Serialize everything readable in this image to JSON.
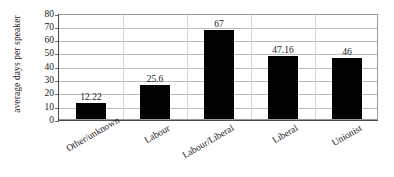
{
  "chart_data": {
    "type": "bar",
    "title": "",
    "xlabel": "",
    "ylabel": "average days per speaker",
    "categories": [
      "Other/unknown",
      "Labour",
      "Labour/Liberal",
      "Liberal",
      "Unionist"
    ],
    "values": [
      12.22,
      25.6,
      67,
      47.16,
      46
    ],
    "value_labels": [
      "12.22",
      "25.6",
      "67",
      "47.16",
      "46"
    ],
    "ylim": [
      0,
      80
    ],
    "ytick_labels": [
      "0",
      "10",
      "20",
      "30",
      "40",
      "50",
      "60",
      "70",
      "80"
    ],
    "ytick_values": [
      0,
      10,
      20,
      30,
      40,
      50,
      60,
      70,
      80
    ],
    "grid": true,
    "legend": "none",
    "bar_color": "#000000",
    "gridline_color": "#b9b9b9",
    "frame_color": "#9a9a9a",
    "text_color": "#1a1a1a",
    "background_color": "#ffffff"
  }
}
